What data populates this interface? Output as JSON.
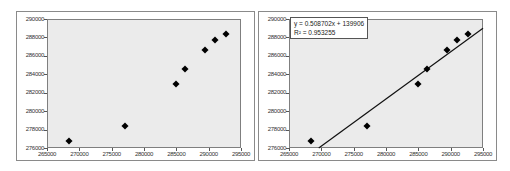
{
  "chart_data": [
    {
      "type": "scatter",
      "title": "",
      "xlabel": "",
      "ylabel": "",
      "xlim": [
        265000,
        295000
      ],
      "ylim": [
        276000,
        290000
      ],
      "x_ticks": [
        "265000",
        "270000",
        "275000",
        "280000",
        "285000",
        "290000",
        "295000"
      ],
      "y_ticks": [
        "290000",
        "288000",
        "286000",
        "284000",
        "282000",
        "280000",
        "278000",
        "276000"
      ],
      "grid": false,
      "legend": "none",
      "series": [
        {
          "name": "data",
          "marker": "diamond",
          "color": "#000000",
          "points": [
            {
              "x": 268400,
              "y": 276800
            },
            {
              "x": 277100,
              "y": 278400
            },
            {
              "x": 285000,
              "y": 282900
            },
            {
              "x": 286300,
              "y": 284600
            },
            {
              "x": 289400,
              "y": 286600
            },
            {
              "x": 291000,
              "y": 287700
            },
            {
              "x": 292700,
              "y": 288400
            }
          ]
        }
      ]
    },
    {
      "type": "scatter",
      "title": "",
      "xlabel": "",
      "ylabel": "",
      "xlim": [
        265000,
        295000
      ],
      "ylim": [
        276000,
        290000
      ],
      "x_ticks": [
        "265000",
        "270000",
        "275000",
        "280000",
        "285000",
        "290000",
        "295000"
      ],
      "y_ticks": [
        "290000",
        "288000",
        "286000",
        "284000",
        "282000",
        "280000",
        "278000",
        "276000"
      ],
      "grid": false,
      "legend": "none",
      "series": [
        {
          "name": "data",
          "marker": "diamond",
          "color": "#000000",
          "points": [
            {
              "x": 268400,
              "y": 276800
            },
            {
              "x": 277100,
              "y": 278400
            },
            {
              "x": 285000,
              "y": 282900
            },
            {
              "x": 286300,
              "y": 284600
            },
            {
              "x": 289400,
              "y": 286600
            },
            {
              "x": 291000,
              "y": 287700
            },
            {
              "x": 292700,
              "y": 288400
            }
          ]
        }
      ],
      "trendline": {
        "type": "linear",
        "equation": "y = 0.508702x + 139906",
        "r_squared": "R² = 0.953255",
        "start": {
          "x": 269600,
          "y": 276000
        },
        "end": {
          "x": 295000,
          "y": 289000
        }
      }
    }
  ],
  "charts": [
    {
      "id": "left",
      "show_trendline": false
    },
    {
      "id": "right",
      "show_trendline": true,
      "equation_line1": "y = 0.508702x + 139906",
      "equation_line2": "R² = 0.953255"
    }
  ]
}
